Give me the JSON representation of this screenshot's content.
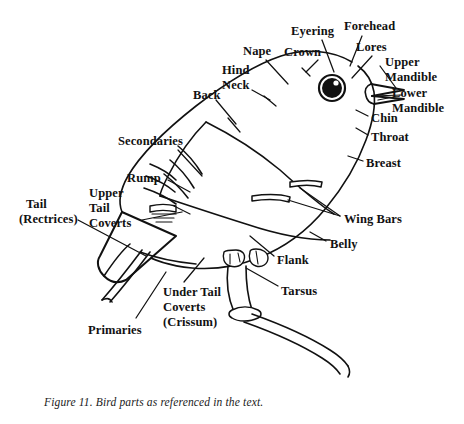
{
  "figure": {
    "caption": "Figure 11. Bird parts as referenced in the text.",
    "title": "Bird parts as referenced in the text",
    "ink_color": "#111111",
    "background_color": "#ffffff"
  },
  "labels": [
    {
      "id": "eyering",
      "text": "Eyering",
      "x": 291,
      "y": 24
    },
    {
      "id": "forehead",
      "text": "Forehead",
      "x": 344,
      "y": 19
    },
    {
      "id": "nape",
      "text": "Nape",
      "x": 243,
      "y": 44
    },
    {
      "id": "crown",
      "text": "Crown",
      "x": 284,
      "y": 45
    },
    {
      "id": "lores",
      "text": "Lores",
      "x": 356,
      "y": 40
    },
    {
      "id": "upper-mandible-1",
      "text": "Upper",
      "x": 385,
      "y": 55
    },
    {
      "id": "upper-mandible-2",
      "text": "Mandible",
      "x": 385,
      "y": 70
    },
    {
      "id": "hind-neck-1",
      "text": "Hind",
      "x": 222,
      "y": 63
    },
    {
      "id": "hind-neck-2",
      "text": "Neck",
      "x": 222,
      "y": 78
    },
    {
      "id": "lower-mandible-1",
      "text": "Lower",
      "x": 392,
      "y": 86
    },
    {
      "id": "lower-mandible-2",
      "text": "Mandible",
      "x": 392,
      "y": 101
    },
    {
      "id": "back",
      "text": "Back",
      "x": 193,
      "y": 88
    },
    {
      "id": "chin",
      "text": "Chin",
      "x": 371,
      "y": 111
    },
    {
      "id": "throat",
      "text": "Throat",
      "x": 371,
      "y": 130
    },
    {
      "id": "secondaries",
      "text": "Secondaries",
      "x": 118,
      "y": 134
    },
    {
      "id": "breast",
      "text": "Breast",
      "x": 366,
      "y": 156
    },
    {
      "id": "rump",
      "text": "Rump",
      "x": 127,
      "y": 171
    },
    {
      "id": "upper-tail-coverts-1",
      "text": "Upper",
      "x": 89,
      "y": 186
    },
    {
      "id": "upper-tail-coverts-2",
      "text": "Tail",
      "x": 89,
      "y": 201
    },
    {
      "id": "upper-tail-coverts-3",
      "text": "Coverts",
      "x": 89,
      "y": 216
    },
    {
      "id": "tail-rectrices-1",
      "text": "Tail",
      "x": 26,
      "y": 197
    },
    {
      "id": "tail-rectrices-2",
      "text": "(Rectrices)",
      "x": 19,
      "y": 212
    },
    {
      "id": "wing-bars",
      "text": "Wing Bars",
      "x": 344,
      "y": 212
    },
    {
      "id": "belly",
      "text": "Belly",
      "x": 330,
      "y": 237
    },
    {
      "id": "flank",
      "text": "Flank",
      "x": 277,
      "y": 253
    },
    {
      "id": "tarsus",
      "text": "Tarsus",
      "x": 281,
      "y": 284
    },
    {
      "id": "under-tail-coverts-1",
      "text": "Under Tail",
      "x": 163,
      "y": 285
    },
    {
      "id": "under-tail-coverts-2",
      "text": "Coverts",
      "x": 163,
      "y": 300
    },
    {
      "id": "under-tail-coverts-3",
      "text": "(Crissum)",
      "x": 163,
      "y": 315
    },
    {
      "id": "primaries",
      "text": "Primaries",
      "x": 88,
      "y": 323
    }
  ],
  "parts_referenced": [
    "Eyering",
    "Forehead",
    "Nape",
    "Crown",
    "Lores",
    "Upper Mandible",
    "Hind Neck",
    "Lower Mandible",
    "Back",
    "Chin",
    "Throat",
    "Secondaries",
    "Breast",
    "Rump",
    "Upper Tail Coverts",
    "Tail (Rectrices)",
    "Wing Bars",
    "Belly",
    "Flank",
    "Tarsus",
    "Under Tail Coverts (Crissum)",
    "Primaries"
  ]
}
